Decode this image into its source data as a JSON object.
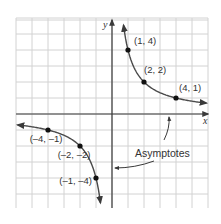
{
  "chart_data": {
    "type": "line",
    "title": "",
    "function": "y = 4/x",
    "xlabel": "x",
    "ylabel": "y",
    "xlim": [
      -6,
      6
    ],
    "ylim": [
      -6,
      6
    ],
    "grid": true,
    "grid_step": 1,
    "series": [
      {
        "name": "right branch",
        "points": [
          [
            1,
            4
          ],
          [
            2,
            2
          ],
          [
            4,
            1
          ]
        ]
      },
      {
        "name": "left branch",
        "points": [
          [
            -4,
            -1
          ],
          [
            -2,
            -2
          ],
          [
            -1,
            -4
          ]
        ]
      }
    ],
    "labeled_points": [
      {
        "x": 1,
        "y": 4,
        "label": "(1, 4)"
      },
      {
        "x": 2,
        "y": 2,
        "label": "(2, 2)"
      },
      {
        "x": 4,
        "y": 1,
        "label": "(4, 1)"
      },
      {
        "x": -4,
        "y": -1,
        "label": "(–4, –1)"
      },
      {
        "x": -2,
        "y": -2,
        "label": "(–2, –2)"
      },
      {
        "x": -1,
        "y": -4,
        "label": "(–1, –4)"
      }
    ],
    "annotations": [
      {
        "text": "Asymptotes",
        "points_to": [
          "x-axis (y = 0)",
          "y-axis (x = 0)"
        ]
      }
    ]
  },
  "colors": {
    "grid": "#d2d2d2",
    "axis": "#3a3a3a",
    "curve": "#4a4a4a",
    "point": "#111111",
    "text": "#333333"
  }
}
